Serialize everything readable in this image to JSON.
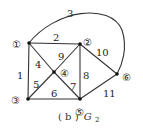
{
  "graph": {
    "caption_prefix": "( b )",
    "caption_name": "G",
    "caption_sub": "2",
    "nodes": [
      {
        "id": "1",
        "label": "①",
        "x": 29,
        "y": 43
      },
      {
        "id": "2",
        "label": "②",
        "x": 80,
        "y": 44
      },
      {
        "id": "3",
        "label": "③",
        "x": 28,
        "y": 99
      },
      {
        "id": "4",
        "label": "④",
        "x": 54,
        "y": 72
      },
      {
        "id": "5",
        "label": "⑤",
        "x": 80,
        "y": 99
      },
      {
        "id": "6",
        "label": "⑥",
        "x": 117,
        "y": 74
      }
    ],
    "edges": [
      {
        "label": "1",
        "from": "1",
        "to": "3"
      },
      {
        "label": "2",
        "from": "1",
        "to": "2"
      },
      {
        "label": "3",
        "from": "1",
        "to": "6",
        "curved": true
      },
      {
        "label": "4",
        "from": "1",
        "to": "4"
      },
      {
        "label": "5",
        "from": "3",
        "to": "4"
      },
      {
        "label": "6",
        "from": "3",
        "to": "5"
      },
      {
        "label": "7",
        "from": "4",
        "to": "5"
      },
      {
        "label": "8",
        "from": "2",
        "to": "5"
      },
      {
        "label": "9",
        "from": "4",
        "to": "2"
      },
      {
        "label": "10",
        "from": "2",
        "to": "6"
      },
      {
        "label": "11",
        "from": "5",
        "to": "6"
      }
    ]
  }
}
